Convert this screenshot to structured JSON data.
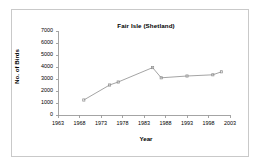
{
  "chart_data": {
    "type": "line",
    "title": "Fair Isle (Shetland)",
    "xlabel": "Year",
    "ylabel": "No. of Birds",
    "xlim": [
      1963,
      2003
    ],
    "ylim": [
      0,
      7000
    ],
    "grid": false,
    "legend": "none",
    "marker": "small-square",
    "line_color": "#8d8d8d",
    "marker_color": "#8d8d8d",
    "axis_color": "#9a9a9a",
    "text_color": "#000000",
    "background": "#ffffff",
    "border_color": "#c9c9c9",
    "x_ticks": [
      1963,
      1968,
      1973,
      1978,
      1983,
      1988,
      1993,
      1998,
      2003
    ],
    "y_ticks": [
      0,
      1000,
      2000,
      3000,
      4000,
      5000,
      6000,
      7000
    ],
    "x_tick_labels": [
      "1963",
      "1968",
      "1973",
      "1978",
      "1983",
      "1988",
      "1993",
      "1998",
      "2003"
    ],
    "y_tick_labels": [
      "0",
      "1000",
      "2000",
      "3000",
      "4000",
      "5000",
      "6000",
      "7000"
    ],
    "x": [
      1969,
      1975,
      1977,
      1985,
      1987,
      1993,
      1999,
      2001
    ],
    "values": [
      1250,
      2500,
      2750,
      3950,
      3100,
      3250,
      3350,
      3600
    ],
    "points": [
      {
        "year": 1969,
        "birds": 1250
      },
      {
        "year": 1975,
        "birds": 2500
      },
      {
        "year": 1977,
        "birds": 2750
      },
      {
        "year": 1985,
        "birds": 3950
      },
      {
        "year": 1987,
        "birds": 3100
      },
      {
        "year": 1993,
        "birds": 3250
      },
      {
        "year": 1999,
        "birds": 3350
      },
      {
        "year": 2001,
        "birds": 3600
      }
    ]
  }
}
